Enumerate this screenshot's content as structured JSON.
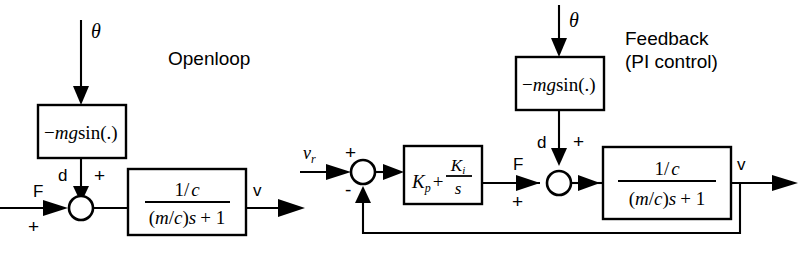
{
  "figure": {
    "type": "control-block-diagram",
    "background": "#ffffff",
    "ink_color": "#000000",
    "width": 807,
    "height": 254
  },
  "openloop": {
    "caption": "Openloop",
    "disturbance_input_label": "θ",
    "gravity_block": {
      "expr_minus": "−",
      "expr_m": "m",
      "expr_g": "g",
      "expr_fn": "sin(.)",
      "full_text": "−mgsin(.)"
    },
    "disturbance_signal_label": "d",
    "force_input_label": "F",
    "sum_signs": {
      "force": "+",
      "disturbance": "+"
    },
    "plant_block": {
      "numerator": "1/ c",
      "numerator_one": "1/",
      "numerator_c": "c",
      "denominator": "(m/c)s + 1",
      "den_open": "(",
      "den_m": "m",
      "den_slash": "/",
      "den_c": "c",
      "den_close": ")",
      "den_s": "s",
      "den_tail": "+ 1"
    },
    "output_label": "v"
  },
  "feedback": {
    "caption_line1": "Feedback",
    "caption_line2": "(PI control)",
    "disturbance_input_label": "θ",
    "reference_label": "v",
    "reference_sub": "r",
    "sum1_signs": {
      "reference": "+",
      "feedback": "-"
    },
    "controller_block": {
      "kp": "K",
      "kp_sub": "p",
      "plus": "+",
      "ki": "K",
      "ki_sub": "i",
      "denominator_s": "s",
      "full_text": "Kp + Ki/s"
    },
    "force_label": "F",
    "gravity_block": {
      "expr_minus": "−",
      "expr_m": "m",
      "expr_g": "g",
      "expr_fn": "sin(.)",
      "full_text": "−mgsin(.)"
    },
    "disturbance_signal_label": "d",
    "sum2_signs": {
      "force": "+",
      "disturbance": "+"
    },
    "plant_block": {
      "numerator_one": "1/",
      "numerator_c": "c",
      "den_open": "(",
      "den_m": "m",
      "den_slash": "/",
      "den_c": "c",
      "den_close": ")",
      "den_s": "s",
      "den_tail": "+ 1",
      "denominator": "(m/c)s + 1"
    },
    "output_label": "v"
  }
}
